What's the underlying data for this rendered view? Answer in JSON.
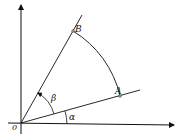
{
  "diagram": {
    "type": "geometric angle diagram",
    "labels": {
      "origin": "0",
      "point_a": "A",
      "point_b": "B",
      "angle_alpha": "α",
      "angle_beta": "β"
    },
    "elements": [
      "horizontal axis with arrow",
      "vertical axis with arrow",
      "ray OA at angle α from horizontal",
      "ray OB at angle β from ray OA",
      "circular arc from B to A centered at O",
      "angle arc α",
      "angle arc β with arrow"
    ]
  }
}
